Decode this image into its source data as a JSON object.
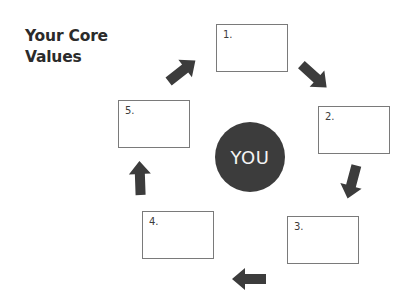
{
  "title": {
    "line1": "Your Core",
    "line2": "Values"
  },
  "center": {
    "label": "YOU",
    "color": "#3c3c3c"
  },
  "boxes": [
    {
      "label": "1.",
      "value": ""
    },
    {
      "label": "2.",
      "value": ""
    },
    {
      "label": "3.",
      "value": ""
    },
    {
      "label": "4.",
      "value": ""
    },
    {
      "label": "5.",
      "value": ""
    }
  ],
  "arrows": [
    {
      "from": "5",
      "to": "1",
      "direction": "up-right"
    },
    {
      "from": "1",
      "to": "2",
      "direction": "down-right"
    },
    {
      "from": "2",
      "to": "3",
      "direction": "down"
    },
    {
      "from": "3",
      "to": "4",
      "direction": "left"
    },
    {
      "from": "4",
      "to": "5",
      "direction": "up"
    }
  ],
  "colors": {
    "arrow": "#3c3c3c",
    "box_border": "#7a7a7a",
    "title": "#2b2b2b"
  }
}
